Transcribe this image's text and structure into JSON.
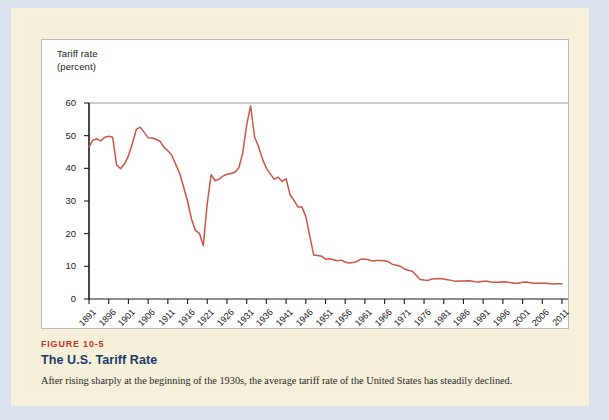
{
  "figure": {
    "number": "FIGURE 10-5",
    "title": "The U.S. Tariff Rate",
    "caption": "After rising sharply at the beginning of the 1930s, the average tariff rate of the United States has steadily declined.",
    "number_color": "#c8361d",
    "title_color": "#1b3a6b"
  },
  "chart_data": {
    "type": "line",
    "title": "The U.S. Tariff Rate",
    "xlabel": "",
    "ylabel": "Tariff rate\n(percent)",
    "ylabel_line1": "Tariff rate",
    "ylabel_line2": "(percent)",
    "xlim": [
      1891,
      2011
    ],
    "ylim": [
      0,
      60
    ],
    "yticks": [
      0,
      10,
      20,
      30,
      40,
      50,
      60
    ],
    "ytick_labels": [
      "0",
      "10",
      "20",
      "30",
      "40",
      "50",
      "60"
    ],
    "xticks": [
      1891,
      1896,
      1901,
      1906,
      1911,
      1916,
      1921,
      1926,
      1931,
      1936,
      1941,
      1946,
      1951,
      1956,
      1961,
      1966,
      1971,
      1976,
      1981,
      1986,
      1991,
      1996,
      2001,
      2006,
      2011
    ],
    "xtick_labels": [
      "1891",
      "1896",
      "1901",
      "1906",
      "1911",
      "1916",
      "1921",
      "1926",
      "1931",
      "1936",
      "1941",
      "1946",
      "1951",
      "1956",
      "1961",
      "1966",
      "1971",
      "1976",
      "1981",
      "1986",
      "1991",
      "1996",
      "2001",
      "2006",
      "2011"
    ],
    "grid": false,
    "legend_position": "none",
    "line_color": "#cc5544",
    "series": [
      {
        "name": "U.S. average tariff rate (percent)",
        "x": [
          1891,
          1892,
          1893,
          1894,
          1895,
          1896,
          1897,
          1898,
          1899,
          1900,
          1901,
          1902,
          1903,
          1904,
          1905,
          1906,
          1907,
          1908,
          1909,
          1910,
          1911,
          1912,
          1913,
          1914,
          1915,
          1916,
          1917,
          1918,
          1919,
          1920,
          1921,
          1922,
          1923,
          1924,
          1925,
          1926,
          1927,
          1928,
          1929,
          1930,
          1931,
          1932,
          1933,
          1934,
          1935,
          1936,
          1937,
          1938,
          1939,
          1940,
          1941,
          1942,
          1943,
          1944,
          1945,
          1946,
          1947,
          1948,
          1949,
          1950,
          1951,
          1952,
          1953,
          1954,
          1955,
          1956,
          1957,
          1958,
          1959,
          1960,
          1961,
          1962,
          1963,
          1964,
          1965,
          1966,
          1967,
          1968,
          1969,
          1970,
          1971,
          1972,
          1973,
          1974,
          1975,
          1976,
          1977,
          1978,
          1979,
          1980,
          1981,
          1982,
          1983,
          1984,
          1985,
          1986,
          1987,
          1988,
          1989,
          1990,
          1991,
          1992,
          1993,
          1994,
          1995,
          1996,
          1997,
          1998,
          1999,
          2000,
          2001,
          2002,
          2003,
          2004,
          2005,
          2006,
          2007,
          2008,
          2009,
          2010,
          2011
        ],
        "values": [
          46.5,
          48.7,
          49.0,
          48.4,
          49.5,
          49.8,
          49.5,
          41.0,
          39.9,
          41.3,
          43.8,
          47.6,
          51.9,
          52.6,
          51.0,
          49.4,
          49.3,
          48.9,
          48.3,
          46.5,
          45.4,
          44.0,
          41.2,
          38.5,
          34.3,
          30.0,
          24.5,
          21.0,
          20.1,
          16.4,
          29.3,
          38.1,
          36.2,
          36.7,
          37.6,
          38.2,
          38.4,
          38.8,
          40.1,
          44.7,
          53.2,
          59.1,
          49.6,
          46.7,
          42.9,
          40.0,
          38.3,
          36.6,
          37.3,
          36.0,
          36.8,
          31.9,
          30.2,
          28.2,
          28.2,
          25.3,
          19.3,
          13.5,
          13.3,
          13.1,
          12.2,
          12.3,
          12.0,
          11.7,
          11.9,
          11.3,
          11.0,
          11.2,
          11.5,
          12.2,
          12.2,
          12.0,
          11.6,
          11.8,
          11.8,
          11.7,
          11.4,
          10.6,
          10.3,
          10.0,
          9.2,
          8.8,
          8.5,
          7.3,
          6.0,
          5.8,
          5.7,
          6.1,
          6.2,
          6.3,
          6.1,
          5.9,
          5.7,
          5.4,
          5.5,
          5.5,
          5.6,
          5.5,
          5.3,
          5.2,
          5.4,
          5.4,
          5.2,
          5.1,
          5.1,
          5.3,
          5.2,
          5.0,
          4.8,
          4.8,
          5.1,
          5.2,
          5.0,
          4.8,
          4.8,
          4.8,
          4.8,
          4.7,
          4.6,
          4.7,
          4.7
        ]
      }
    ]
  }
}
